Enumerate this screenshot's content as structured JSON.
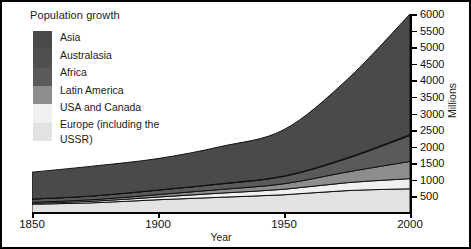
{
  "chart_title": "Population growth",
  "axes": {
    "xlabel": "Year",
    "ylabel": "Millions",
    "xticks": [
      1850,
      1900,
      1950,
      2000
    ],
    "xtick_labels": [
      "1850",
      "1900",
      "1950",
      "2000"
    ],
    "yticks": [
      500,
      1000,
      1500,
      2000,
      2500,
      3000,
      3500,
      4000,
      4500,
      5000,
      5500,
      6000
    ],
    "ytick_labels": [
      "500",
      "1000",
      "1500",
      "2000",
      "2500",
      "3000",
      "3500",
      "4000",
      "4500",
      "5000",
      "5500",
      "6000"
    ],
    "xlim": [
      1850,
      2000
    ],
    "ylim": [
      0,
      6000
    ],
    "y_axis_side": "right",
    "grid": false
  },
  "legend": {
    "position": "top-left",
    "items": [
      {
        "label": "Asia",
        "color": "#4a4a4a"
      },
      {
        "label": "Australasia",
        "color": "#4f4f4f"
      },
      {
        "label": "Africa",
        "color": "#5a5a5a"
      },
      {
        "label": "Latin America",
        "color": "#8d8d8d"
      },
      {
        "label": "USA and Canada",
        "color": "#f0f0f0"
      },
      {
        "label": "Europe (including the USSR)",
        "color": "#e2e2e2"
      }
    ]
  },
  "chart_data": {
    "type": "area",
    "stacked": true,
    "title": "Population growth",
    "xlabel": "Year",
    "ylabel": "Millions",
    "xlim": [
      1850,
      2000
    ],
    "ylim": [
      0,
      6000
    ],
    "grid": false,
    "legend_position": "top-left",
    "x": [
      1850,
      1875,
      1900,
      1925,
      1950,
      1975,
      2000
    ],
    "series": [
      {
        "name": "Europe (including the USSR)",
        "color": "#e2e2e2",
        "values": [
          265,
          310,
          400,
          475,
          550,
          675,
          730
        ]
      },
      {
        "name": "USA and Canada",
        "color": "#f0f0f0",
        "values": [
          26,
          48,
          81,
          125,
          166,
          239,
          305
        ]
      },
      {
        "name": "Latin America",
        "color": "#8d8d8d",
        "values": [
          33,
          48,
          74,
          110,
          166,
          322,
          520
        ]
      },
      {
        "name": "Africa",
        "color": "#5a5a5a",
        "values": [
          95,
          110,
          133,
          165,
          221,
          406,
          780
        ]
      },
      {
        "name": "Australasia",
        "color": "#4f4f4f",
        "values": [
          2,
          4,
          6,
          10,
          13,
          21,
          30
        ]
      },
      {
        "name": "Asia",
        "color": "#4a4a4a",
        "values": [
          809,
          900,
          947,
          1120,
          1398,
          2357,
          3635
        ]
      }
    ],
    "totals": [
      1230,
      1420,
      1641,
      2005,
      2514,
      4020,
      6000
    ],
    "stack_order_bottom_to_top": [
      "Europe (including the USSR)",
      "USA and Canada",
      "Latin America",
      "Africa",
      "Australasia",
      "Asia"
    ]
  }
}
